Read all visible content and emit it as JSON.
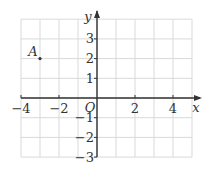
{
  "diagram": {
    "type": "coordinate-grid",
    "axes": {
      "x_label": "x",
      "y_label": "y",
      "origin_label": "O",
      "x_range": [
        -4,
        5
      ],
      "y_range": [
        -3,
        4
      ],
      "x_ticks": [
        {
          "value": -4,
          "label": "−4"
        },
        {
          "value": -2,
          "label": "−2"
        },
        {
          "value": 2,
          "label": "2"
        },
        {
          "value": 4,
          "label": "4"
        }
      ],
      "y_ticks": [
        {
          "value": 3,
          "label": "3"
        },
        {
          "value": 2,
          "label": "2"
        },
        {
          "value": 1,
          "label": "1"
        },
        {
          "value": -1,
          "label": "−1"
        },
        {
          "value": -2,
          "label": "−2"
        },
        {
          "value": -3,
          "label": "−3"
        }
      ]
    },
    "points": [
      {
        "name": "A",
        "x": -3,
        "y": 2
      }
    ],
    "colors": {
      "grid": "#d9d9d9",
      "axis": "#333333",
      "text": "#333333"
    }
  }
}
